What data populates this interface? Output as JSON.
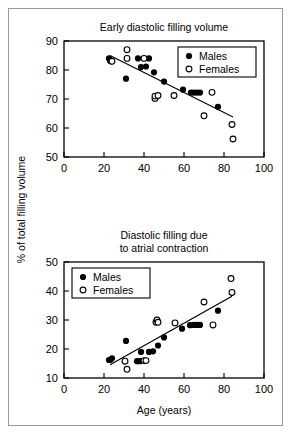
{
  "figure": {
    "ylabel": "% of total filling volume",
    "xlabel": "Age (years)"
  },
  "legend": {
    "males_label": "Males",
    "females_label": "Females"
  },
  "chart_data": [
    {
      "type": "scatter",
      "title": "Early diastolic filling volume",
      "xlabel": "",
      "ylabel": "% of total filling volume",
      "xlim": [
        0,
        100
      ],
      "ylim": [
        50,
        90
      ],
      "xticks": [
        0,
        20,
        40,
        60,
        80,
        100
      ],
      "yticks": [
        50,
        60,
        70,
        80,
        90
      ],
      "grid": false,
      "legend_position": "top-right",
      "series": [
        {
          "name": "Males",
          "marker": "filled-circle",
          "points": [
            [
              22.5,
              84.0
            ],
            [
              23.0,
              83.2
            ],
            [
              23.5,
              83.0
            ],
            [
              31.0,
              77.0
            ],
            [
              37.0,
              84.0
            ],
            [
              38.5,
              81.0
            ],
            [
              41.0,
              81.2
            ],
            [
              42.5,
              84.0
            ],
            [
              45.0,
              79.2
            ],
            [
              50.0,
              76.0
            ],
            [
              59.5,
              73.2
            ],
            [
              63.5,
              72.2
            ],
            [
              65.0,
              72.2
            ],
            [
              66.5,
              72.2
            ],
            [
              68.0,
              72.2
            ],
            [
              77.0,
              67.3
            ]
          ]
        },
        {
          "name": "Females",
          "marker": "open-circle",
          "points": [
            [
              24.0,
              83.0
            ],
            [
              31.5,
              87.0
            ],
            [
              31.5,
              84.0
            ],
            [
              40.0,
              84.0
            ],
            [
              45.5,
              70.2
            ],
            [
              45.5,
              71.0
            ],
            [
              47.0,
              71.2
            ],
            [
              55.0,
              71.2
            ],
            [
              70.0,
              64.2
            ],
            [
              74.0,
              72.3
            ],
            [
              84.0,
              61.2
            ],
            [
              84.5,
              56.2
            ]
          ]
        }
      ],
      "fit_line": {
        "x": [
          23.0,
          84.5
        ],
        "y": [
          85.0,
          63.8
        ]
      }
    },
    {
      "type": "scatter",
      "title": "Diastolic filling due to atrial contraction",
      "title_lines": [
        "Diastolic filling due",
        "to atrial contraction"
      ],
      "xlabel": "Age (years)",
      "ylabel": "% of total filling volume",
      "xlim": [
        0,
        100
      ],
      "ylim": [
        10,
        50
      ],
      "xticks": [
        0,
        20,
        40,
        60,
        80,
        100
      ],
      "yticks": [
        10,
        20,
        30,
        40,
        50
      ],
      "grid": false,
      "legend_position": "top-left",
      "series": [
        {
          "name": "Males",
          "marker": "filled-circle",
          "points": [
            [
              22.5,
              16.2
            ],
            [
              23.2,
              16.3
            ],
            [
              24.0,
              16.8
            ],
            [
              31.0,
              22.8
            ],
            [
              36.5,
              15.8
            ],
            [
              38.0,
              15.8
            ],
            [
              38.5,
              19.0
            ],
            [
              42.5,
              19.0
            ],
            [
              44.5,
              19.2
            ],
            [
              47.0,
              21.2
            ],
            [
              50.0,
              24.0
            ],
            [
              59.0,
              27.0
            ],
            [
              63.0,
              28.2
            ],
            [
              65.0,
              28.3
            ],
            [
              66.5,
              28.3
            ],
            [
              68.0,
              28.3
            ],
            [
              77.0,
              33.2
            ]
          ]
        },
        {
          "name": "Females",
          "marker": "open-circle",
          "points": [
            [
              30.5,
              15.8
            ],
            [
              31.5,
              13.0
            ],
            [
              40.0,
              16.0
            ],
            [
              41.0,
              16.0
            ],
            [
              46.0,
              29.2
            ],
            [
              46.5,
              30.0
            ],
            [
              47.0,
              29.2
            ],
            [
              55.5,
              29.0
            ],
            [
              70.0,
              36.2
            ],
            [
              74.5,
              28.3
            ],
            [
              83.5,
              44.3
            ],
            [
              84.0,
              39.5
            ]
          ]
        }
      ],
      "fit_line": {
        "x": [
          23.0,
          84.0
        ],
        "y": [
          14.6,
          38.2
        ]
      }
    }
  ]
}
